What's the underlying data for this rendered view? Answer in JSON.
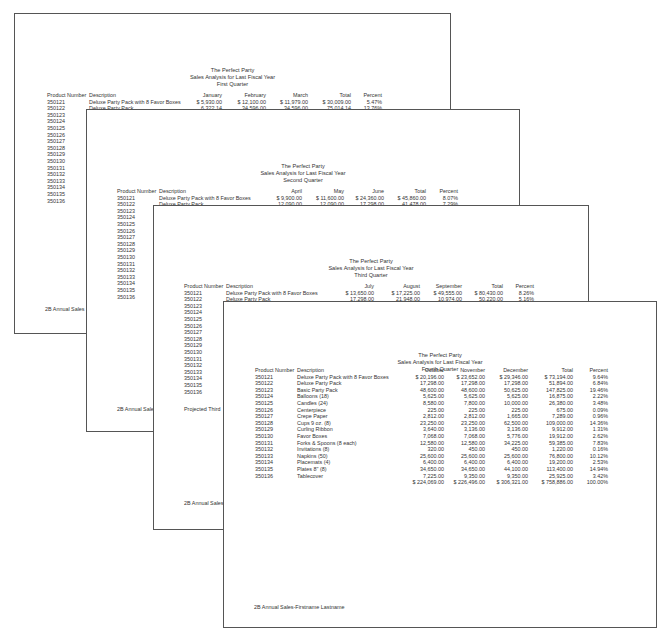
{
  "document": {
    "company": "The Perfect Party",
    "report_title": "Sales Analysis for Last Fiscal Year",
    "footer_truncated": "2B Annual Sales",
    "footer_full": "2B Annual Sales-Firstname Lastname",
    "projected_note": "Projected Third",
    "headers": {
      "product_number": "Product Number",
      "description": "Description",
      "total": "Total",
      "percent": "Percent"
    },
    "product_numbers": [
      "350121",
      "350122",
      "350123",
      "350124",
      "350125",
      "350126",
      "350127",
      "350128",
      "350129",
      "350130",
      "350131",
      "350132",
      "350133",
      "350134",
      "350135",
      "350136"
    ],
    "pages": [
      {
        "quarter": "First Quarter",
        "months": [
          "January",
          "February",
          "March"
        ],
        "rows": [
          {
            "desc": "Deluxe Party Pack with 8 Favor Boxes",
            "m1": "$  5,930.00",
            "m2": "$  12,100.00",
            "m3": "$  11,979.00",
            "total": "$  30,009.00",
            "pct": "5.47%"
          },
          {
            "desc": "Deluxe Party Pack",
            "m1": "6,322.14",
            "m2": "34,596.00",
            "m3": "34,596.00",
            "total": "75,014.14",
            "pct": "13.76%"
          },
          {
            "desc": "Basic Party Pack",
            "m1": "5,622.75",
            "m2": "15,300.00",
            "m3": "15,300.00",
            "total": "36,222.75",
            "pct": "6.60%"
          },
          {
            "desc": "Balloons (18)",
            "m1": "281.25",
            "m2": "5,625.00",
            "m3": "5,625.00",
            "total": "11,531.25",
            "pct": "2.10%"
          }
        ]
      },
      {
        "quarter": "Second Quarter",
        "months": [
          "April",
          "May",
          "June"
        ],
        "rows": [
          {
            "desc": "Deluxe Party Pack with 8 Favor Boxes",
            "m1": "$  9,900.00",
            "m2": "$  11,600.00",
            "m3": "$  24,360.00",
            "total": "$  45,860.00",
            "pct": "8.07%"
          },
          {
            "desc": "Deluxe Party Pack",
            "m1": "12,090.00",
            "m2": "12,090.00",
            "m3": "17,298.00",
            "total": "41,478.00",
            "pct": "7.29%"
          },
          {
            "desc": "Basic Party Pack",
            "m1": "20,925.00",
            "m2": "20,925.00",
            "m3": "50,625.00",
            "total": "92,475.00",
            "pct": "16.26%"
          },
          {
            "desc": "Balloons (18)",
            "m1": "3,975.00",
            "m2": "3,975.00",
            "m3": "5,625.00",
            "total": "13,575.00",
            "pct": "2.39%"
          }
        ]
      },
      {
        "quarter": "Third Quarter",
        "months": [
          "July",
          "August",
          "September"
        ],
        "rows": [
          {
            "desc": "Deluxe Party Pack with 8 Favor Boxes",
            "m1": "$  13,650.00",
            "m2": "$  17,225.00",
            "m3": "$  49,555.00",
            "total": "$  80,430.00",
            "pct": "8.26%"
          },
          {
            "desc": "Deluxe Party Pack",
            "m1": "17,298.00",
            "m2": "21,948.00",
            "m3": "10,974.00",
            "total": "50,220.00",
            "pct": "5.16%"
          },
          {
            "desc": "Basic Party Pack",
            "m1": "50,625.00",
            "m2": "95,625.00",
            "m3": "95,625.00",
            "total": "241,875.00",
            "pct": "24.85%"
          },
          {
            "desc": "Balloons (18)",
            "m1": "5,625.00",
            "m2": "5,625.00",
            "m3": "5,625.00",
            "total": "16,875.00",
            "pct": "1.73%"
          }
        ]
      },
      {
        "quarter": "Fourth Quarter",
        "months": [
          "October",
          "November",
          "December"
        ],
        "rows": [
          {
            "desc": "Deluxe Party Pack with 8 Favor Boxes",
            "m1": "$  20,196.00",
            "m2": "$  23,652.00",
            "m3": "$  29,346.00",
            "total": "$  73,194.00",
            "pct": "9.64%"
          },
          {
            "desc": "Deluxe Party Pack",
            "m1": "17,298.00",
            "m2": "17,298.00",
            "m3": "17,298.00",
            "total": "51,894.00",
            "pct": "6.84%"
          },
          {
            "desc": "Basic Party Pack",
            "m1": "48,600.00",
            "m2": "48,600.00",
            "m3": "50,625.00",
            "total": "147,825.00",
            "pct": "19.46%"
          },
          {
            "desc": "Balloons (18)",
            "m1": "5,625.00",
            "m2": "5,625.00",
            "m3": "5,625.00",
            "total": "16,875.00",
            "pct": "2.22%"
          },
          {
            "desc": "Candles (24)",
            "m1": "8,580.00",
            "m2": "7,800.00",
            "m3": "10,000.00",
            "total": "26,380.00",
            "pct": "3.48%"
          },
          {
            "desc": "Centerpiece",
            "m1": "225.00",
            "m2": "225.00",
            "m3": "225.00",
            "total": "675.00",
            "pct": "0.09%"
          },
          {
            "desc": "Crepe Paper",
            "m1": "2,812.00",
            "m2": "2,812.00",
            "m3": "1,665.00",
            "total": "7,289.00",
            "pct": "0.96%"
          },
          {
            "desc": "Cups 9 oz. (8)",
            "m1": "23,250.00",
            "m2": "23,250.00",
            "m3": "62,500.00",
            "total": "109,000.00",
            "pct": "14.36%"
          },
          {
            "desc": "Curling Ribbon",
            "m1": "3,640.00",
            "m2": "3,136.00",
            "m3": "3,136.00",
            "total": "9,912.00",
            "pct": "1.31%"
          },
          {
            "desc": "Favor Boxes",
            "m1": "7,068.00",
            "m2": "7,068.00",
            "m3": "5,776.00",
            "total": "19,912.00",
            "pct": "2.62%"
          },
          {
            "desc": "Forks & Spoons (8 each)",
            "m1": "12,580.00",
            "m2": "12,580.00",
            "m3": "34,225.00",
            "total": "59,385.00",
            "pct": "7.83%"
          },
          {
            "desc": "Invitations (8)",
            "m1": "320.00",
            "m2": "450.00",
            "m3": "450.00",
            "total": "1,220.00",
            "pct": "0.16%"
          },
          {
            "desc": "Napkins (50)",
            "m1": "25,600.00",
            "m2": "25,600.00",
            "m3": "25,600.00",
            "total": "76,800.00",
            "pct": "10.12%"
          },
          {
            "desc": "Placemats (4)",
            "m1": "6,400.00",
            "m2": "6,400.00",
            "m3": "6,400.00",
            "total": "19,200.00",
            "pct": "2.53%"
          },
          {
            "desc": "Plates 8\" (8)",
            "m1": "34,650.00",
            "m2": "34,650.00",
            "m3": "44,100.00",
            "total": "113,400.00",
            "pct": "14.94%"
          },
          {
            "desc": "Tablecover",
            "m1": "7,225.00",
            "m2": "9,350.00",
            "m3": "9,350.00",
            "total": "25,925.00",
            "pct": "3.42%"
          }
        ],
        "totals": {
          "m1": "$ 224,069.00",
          "m2": "$ 226,496.00",
          "m3": "$ 306,321.00",
          "total": "$ 758,886.00",
          "pct": "100.00%"
        }
      }
    ]
  }
}
